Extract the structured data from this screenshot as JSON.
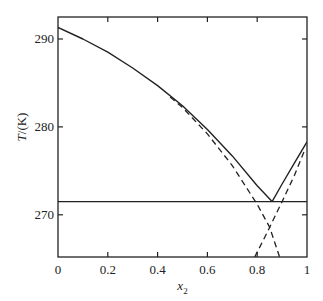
{
  "chart_data": {
    "type": "line",
    "title": "",
    "xlabel": "x2",
    "xlabel_main": "x",
    "xlabel_sub": "2",
    "ylabel": "T/(K)",
    "xlim": [
      0,
      1
    ],
    "ylim": [
      265.2,
      292.5
    ],
    "xticks": [
      0,
      0.2,
      0.4,
      0.6,
      0.8,
      1
    ],
    "xtick_labels": [
      "0",
      "0.2",
      "0.4",
      "0.6",
      "0.8",
      "1"
    ],
    "yticks": [
      270,
      280,
      290
    ],
    "ytick_labels": [
      "270",
      "280",
      "290"
    ],
    "grid": false,
    "legend": null,
    "series": [
      {
        "name": "liquidus (component 1, solid)",
        "style": "solid",
        "x": [
          0,
          0.1,
          0.2,
          0.3,
          0.4,
          0.5,
          0.6,
          0.7,
          0.8,
          0.86
        ],
        "y": [
          291.3,
          290.0,
          288.5,
          286.7,
          284.7,
          282.4,
          279.7,
          276.7,
          273.3,
          271.5
        ]
      },
      {
        "name": "liquidus (component 2, solid)",
        "style": "solid",
        "x": [
          0.86,
          0.9,
          0.95,
          1.0
        ],
        "y": [
          271.5,
          273.5,
          275.9,
          278.3
        ]
      },
      {
        "name": "ideal solubility curve 1 (dashed)",
        "style": "dashed",
        "x": [
          0.45,
          0.5,
          0.6,
          0.7,
          0.8,
          0.85,
          0.89
        ],
        "y": [
          283.4,
          282.2,
          279.2,
          275.6,
          271.2,
          268.6,
          265.2
        ]
      },
      {
        "name": "ideal solubility curve 2 (dashed)",
        "style": "dashed",
        "x": [
          0.79,
          0.84,
          0.9,
          0.95,
          0.99
        ],
        "y": [
          265.2,
          268.0,
          271.5,
          274.5,
          277.3
        ]
      },
      {
        "name": "eutectic temperature",
        "style": "solid",
        "x": [
          0,
          1
        ],
        "y": [
          271.5,
          271.5
        ]
      }
    ],
    "annotations": [
      {
        "type": "eutectic_point",
        "x": 0.86,
        "y": 271.5
      }
    ]
  }
}
